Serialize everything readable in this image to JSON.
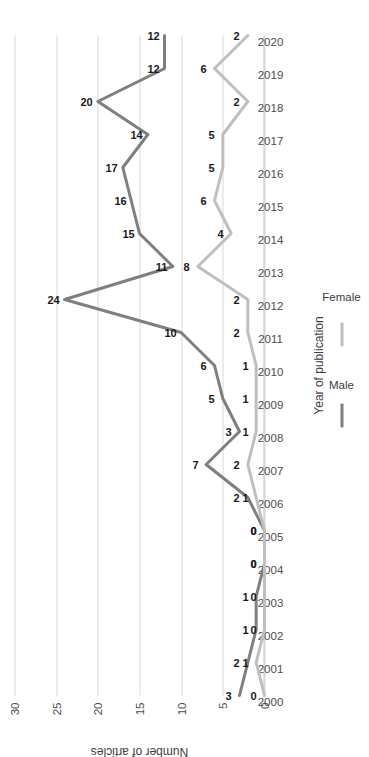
{
  "chart_data": {
    "type": "line",
    "title": "",
    "xlabel": "Year of publication",
    "ylabel": "Number of articles",
    "ylim": [
      0,
      30
    ],
    "yticks": [
      0,
      5,
      10,
      15,
      20,
      25,
      30
    ],
    "grid": true,
    "legend_position": "bottom",
    "orientation": "rotated-90-ccw",
    "categories": [
      "2000",
      "2001",
      "2002",
      "2003",
      "2004",
      "2005",
      "2006",
      "2007",
      "2008",
      "2009",
      "2010",
      "2011",
      "2012",
      "2013",
      "2014",
      "2015",
      "2016",
      "2017",
      "2018",
      "2019",
      "2020"
    ],
    "series": [
      {
        "name": "Male",
        "color": "#7f7f7f",
        "values": [
          3,
          2,
          1,
          1,
          0,
          0,
          2,
          7,
          3,
          5,
          6,
          10,
          24,
          11,
          15,
          16,
          17,
          14,
          20,
          12,
          12
        ]
      },
      {
        "name": "Female",
        "color": "#bfbfbf",
        "values": [
          0,
          1,
          0,
          0,
          0,
          0,
          1,
          2,
          1,
          1,
          1,
          2,
          2,
          8,
          4,
          6,
          5,
          5,
          2,
          6,
          2
        ]
      }
    ]
  },
  "legend": {
    "items": [
      {
        "label": "Male",
        "color": "#7f7f7f"
      },
      {
        "label": "Female",
        "color": "#bfbfbf"
      }
    ]
  },
  "axes": {
    "y_title": "Number of articles",
    "x_title": "Year of publication"
  }
}
